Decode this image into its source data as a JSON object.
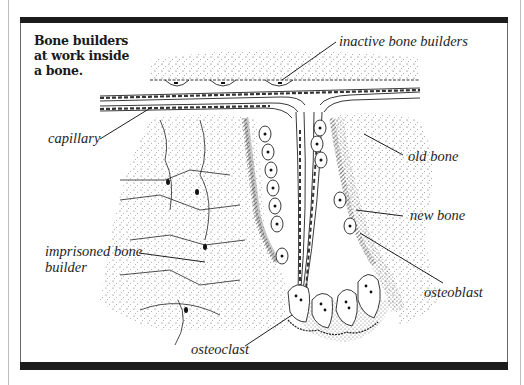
{
  "figure": {
    "title": "Bone builders at work inside a bone.",
    "title_lines": [
      "Bone builders",
      "at work inside",
      "a bone."
    ],
    "labels": {
      "inactive_bone_builders": "inactive bone builders",
      "capillary": "capillary",
      "old_bone": "old bone",
      "new_bone": "new bone",
      "imprisoned_bone_builder_line1": "imprisoned bone",
      "imprisoned_bone_builder_line2": "builder",
      "osteoblast": "osteoblast",
      "osteoclast": "osteoclast"
    },
    "colors": {
      "ink": "#1e1e1e",
      "frame_bar": "#1c1c1c",
      "background": "#ffffff"
    }
  }
}
